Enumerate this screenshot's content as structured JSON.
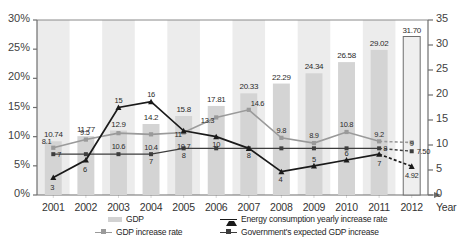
{
  "chart_data": {
    "type": "bar",
    "title": "",
    "xlabel": "Year",
    "ylabel": "",
    "categories": [
      "2001",
      "2002",
      "2003",
      "2004",
      "2005",
      "2006",
      "2007",
      "2008",
      "2009",
      "2010",
      "2011",
      "2012"
    ],
    "ylim": [
      0,
      30
    ],
    "ylim_right": [
      0,
      35
    ],
    "y_left_ticks": [
      "0%",
      "5%",
      "10%",
      "15%",
      "20%",
      "25%",
      "30%"
    ],
    "y_right_ticks": [
      "0",
      "5",
      "10",
      "15",
      "20",
      "25",
      "30",
      "35"
    ],
    "grid": false,
    "legend_position": "bottom",
    "series": [
      {
        "name": "GDP",
        "type": "bar",
        "axis": "right",
        "color": "#d4d4d4",
        "values": [
          10.74,
          11.77,
          12.9,
          14.2,
          15.8,
          17.81,
          20.33,
          22.29,
          24.34,
          26.58,
          29.02,
          31.7
        ],
        "labels": [
          "10.74",
          "11.77",
          "12.9",
          "14.2",
          "15.8",
          "17.81",
          "20.33",
          "22.29",
          "24.34",
          "26.58",
          "29.02",
          "31.70"
        ]
      },
      {
        "name": "GDP increase rate",
        "type": "line",
        "axis": "left",
        "color": "#9a9a9a",
        "marker": "square",
        "values": [
          8.1,
          9.5,
          10.6,
          10.4,
          10.7,
          13.3,
          14.6,
          9.8,
          8.9,
          10.8,
          9.2,
          9
        ],
        "labels": [
          "8.1",
          "9.5",
          "10.6",
          "10.4",
          "10.7",
          "13.3",
          "14.6",
          "9.8",
          "8.9",
          "10.8",
          "9.2",
          "9"
        ],
        "projected_from": "2011"
      },
      {
        "name": "Energy consumption yearly increase rate",
        "type": "line",
        "axis": "left",
        "color": "#1a1a1a",
        "marker": "triangle",
        "values": [
          3,
          6,
          15,
          16,
          11,
          10,
          8,
          4,
          5,
          6,
          7,
          4.92
        ],
        "labels": [
          "3",
          "6",
          "15",
          "16",
          "11",
          "10",
          "8",
          "4",
          "5",
          "6",
          "7",
          "4.92"
        ],
        "projected_from": "2011"
      },
      {
        "name": "Government's expected GDP increase",
        "type": "line",
        "axis": "left",
        "color": "#3d3d3d",
        "marker": "square",
        "values": [
          7,
          7,
          7,
          7,
          8,
          8,
          8,
          8,
          8,
          8,
          8,
          7.5
        ],
        "labels": [
          "7",
          "",
          "",
          "7",
          "8",
          "",
          "",
          "",
          "",
          "",
          "8",
          "7.50"
        ],
        "projected_from": "2011"
      }
    ],
    "annotations": [
      {
        "text": "7.50",
        "series": "Government's expected GDP increase",
        "x": "2012"
      },
      {
        "text": "4.92",
        "series": "Energy consumption yearly increase rate",
        "x": "2012"
      },
      {
        "text": "9",
        "series": "GDP increase rate",
        "x": "2012"
      },
      {
        "text": "31.70",
        "series": "GDP",
        "x": "2012"
      }
    ]
  },
  "legend": {
    "items": [
      {
        "label": "GDP",
        "marker": "bar-swatch",
        "color": "#d2d2d2"
      },
      {
        "label": "GDP increase rate",
        "marker": "line-square",
        "color": "#9a9a9a"
      },
      {
        "label": "Energy consumption yearly increase rate",
        "marker": "line-triangle",
        "color": "#1a1a1a"
      },
      {
        "label": "Government's expected GDP increase",
        "marker": "line-square",
        "color": "#3d3d3d"
      }
    ]
  },
  "axis": {
    "x_title": "Year"
  }
}
